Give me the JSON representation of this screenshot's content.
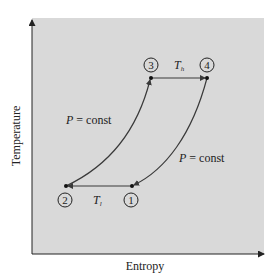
{
  "diagram": {
    "type": "T-S diagram",
    "x_axis_label": "Entropy",
    "y_axis_label": "Temperature",
    "colors": {
      "panel": "#d9d9d9",
      "line": "#3a3a3a"
    },
    "states": [
      {
        "id": "1",
        "label": "1"
      },
      {
        "id": "2",
        "label": "2"
      },
      {
        "id": "3",
        "label": "3"
      },
      {
        "id": "4",
        "label": "4"
      }
    ],
    "processes": [
      {
        "from": "1",
        "to": "2",
        "label_main": "T",
        "label_sub": "l"
      },
      {
        "from": "2",
        "to": "3",
        "label": "P = const"
      },
      {
        "from": "3",
        "to": "4",
        "label_main": "T",
        "label_sub": "h"
      },
      {
        "from": "4",
        "to": "1",
        "label": "P = const"
      }
    ],
    "left_curve_label": {
      "italic": "P",
      "rest": " = const"
    },
    "right_curve_label": {
      "italic": "P",
      "rest": " = const"
    },
    "top_label": {
      "main": "T",
      "sub": "h"
    },
    "bottom_label": {
      "main": "T",
      "sub": "l"
    }
  }
}
